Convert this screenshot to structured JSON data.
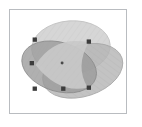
{
  "figure": {
    "background_color": "#ffffff",
    "frame": {
      "border_color": "#b9bcc0",
      "border_width": 1,
      "x": 9,
      "y": 9,
      "width": 118,
      "height": 105
    },
    "palette": {
      "ellipse_fill": "#9a9a9a",
      "ellipse_stroke": "#8e8e8e",
      "light_region": "#cfcfcf",
      "mid_region": "#a8a8a8",
      "dark_region": "#8a8a8a",
      "center_region": "#c6c6c6",
      "marker_color": "#3c3c3c",
      "center_dot_color": "#4a4a4a",
      "hatch_color": "#b0b0b0"
    }
  },
  "chart_data": {
    "type": "scatter",
    "xlabel": "",
    "ylabel": "",
    "xlim": [
      0,
      118
    ],
    "ylim": [
      0,
      105
    ],
    "grid": false,
    "legend": "none",
    "ellipses": [
      {
        "name": "ellipse-top",
        "cx": 62,
        "cy": 38,
        "rx": 40,
        "ry": 27,
        "rotation": -4,
        "fill": "#cfcfcf",
        "opacity": 0.72
      },
      {
        "name": "ellipse-left",
        "cx": 50,
        "cy": 58,
        "rx": 39,
        "ry": 25,
        "rotation": 17,
        "fill": "#9a9a9a",
        "opacity": 0.72
      },
      {
        "name": "ellipse-right",
        "cx": 74,
        "cy": 62,
        "rx": 42,
        "ry": 26,
        "rotation": -18,
        "fill": "#b4b4b4",
        "opacity": 0.72
      }
    ],
    "markers": [
      {
        "name": "marker-top-left",
        "x": 25,
        "y": 30,
        "size": 4
      },
      {
        "name": "marker-top-right",
        "x": 80,
        "y": 32,
        "size": 4
      },
      {
        "name": "marker-mid-left",
        "x": 22,
        "y": 54,
        "size": 4
      },
      {
        "name": "marker-bottom-left",
        "x": 25,
        "y": 80,
        "size": 4
      },
      {
        "name": "marker-bottom-mid",
        "x": 54,
        "y": 80,
        "size": 4
      },
      {
        "name": "marker-bottom-right",
        "x": 80,
        "y": 79,
        "size": 4
      }
    ],
    "center_point": {
      "name": "center-dot",
      "x": 53,
      "y": 54,
      "size": 2
    }
  }
}
